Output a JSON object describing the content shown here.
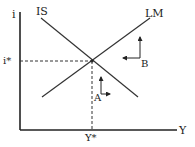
{
  "diagram": {
    "type": "IS-LM",
    "axes": {
      "y_label": "i",
      "x_label": "Y"
    },
    "curves": [
      {
        "id": "IS",
        "label": "IS",
        "slope": "downward"
      },
      {
        "id": "LM",
        "label": "LM",
        "slope": "upward"
      }
    ],
    "equilibrium": {
      "i_label": "i*",
      "y_label": "Y*"
    },
    "points": [
      {
        "label": "A",
        "arrows": [
          "up",
          "right"
        ],
        "region": "below intersection"
      },
      {
        "label": "B",
        "arrows": [
          "up",
          "left"
        ],
        "region": "right of intersection"
      }
    ],
    "colors": {
      "line": "#333333",
      "axis": "#222222",
      "dashed": "#333333"
    }
  }
}
